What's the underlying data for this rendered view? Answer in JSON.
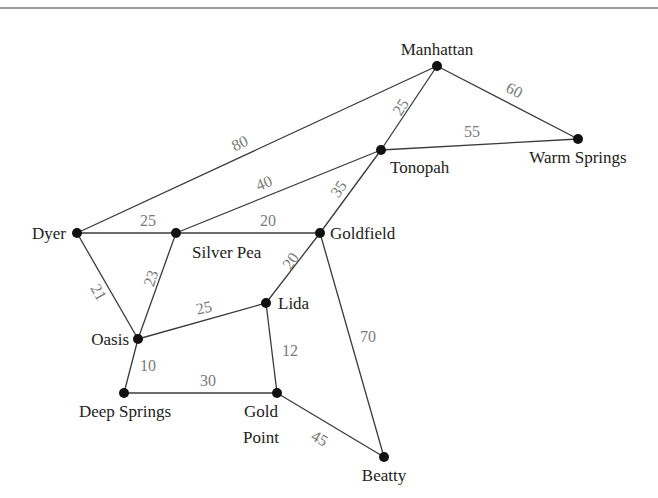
{
  "diagram": {
    "type": "weighted-graph",
    "colors": {
      "edge": "#3a3a3a",
      "node": "#111111",
      "node_label": "#222222",
      "weight_label": "#7a7a7a",
      "rule": "#7a7a7a"
    },
    "nodes": [
      {
        "id": "manhattan",
        "label": "Manhattan",
        "x": 437,
        "y": 66
      },
      {
        "id": "tonopah",
        "label": "Tonopah",
        "x": 381,
        "y": 150
      },
      {
        "id": "warm_springs",
        "label": "Warm Springs",
        "x": 578,
        "y": 139
      },
      {
        "id": "dyer",
        "label": "Dyer",
        "x": 77,
        "y": 233
      },
      {
        "id": "silver_pea",
        "label": "Silver Pea",
        "x": 176,
        "y": 233
      },
      {
        "id": "goldfield",
        "label": "Goldfield",
        "x": 320,
        "y": 233
      },
      {
        "id": "lida",
        "label": "Lida",
        "x": 266,
        "y": 303
      },
      {
        "id": "oasis",
        "label": "Oasis",
        "x": 138,
        "y": 339
      },
      {
        "id": "deep_springs",
        "label": "Deep Springs",
        "x": 124,
        "y": 393
      },
      {
        "id": "gold_point",
        "label": "Gold Point",
        "label_lines": [
          "Gold",
          "Point"
        ],
        "x": 277,
        "y": 393
      },
      {
        "id": "beatty",
        "label": "Beatty",
        "x": 384,
        "y": 457
      }
    ],
    "edges": [
      {
        "from": "dyer",
        "to": "manhattan",
        "weight": "80"
      },
      {
        "from": "manhattan",
        "to": "tonopah",
        "weight": "25"
      },
      {
        "from": "manhattan",
        "to": "warm_springs",
        "weight": "60"
      },
      {
        "from": "tonopah",
        "to": "warm_springs",
        "weight": "55"
      },
      {
        "from": "silver_pea",
        "to": "tonopah",
        "weight": "40"
      },
      {
        "from": "goldfield",
        "to": "tonopah",
        "weight": "35"
      },
      {
        "from": "dyer",
        "to": "silver_pea",
        "weight": "25"
      },
      {
        "from": "silver_pea",
        "to": "goldfield",
        "weight": "20"
      },
      {
        "from": "dyer",
        "to": "oasis",
        "weight": "21"
      },
      {
        "from": "silver_pea",
        "to": "oasis",
        "weight": "23"
      },
      {
        "from": "goldfield",
        "to": "lida",
        "weight": "20"
      },
      {
        "from": "oasis",
        "to": "lida",
        "weight": "25"
      },
      {
        "from": "goldfield",
        "to": "beatty",
        "weight": "70"
      },
      {
        "from": "lida",
        "to": "gold_point",
        "weight": "12"
      },
      {
        "from": "oasis",
        "to": "deep_springs",
        "weight": "10"
      },
      {
        "from": "deep_springs",
        "to": "gold_point",
        "weight": "30"
      },
      {
        "from": "gold_point",
        "to": "beatty",
        "weight": "45"
      }
    ]
  }
}
